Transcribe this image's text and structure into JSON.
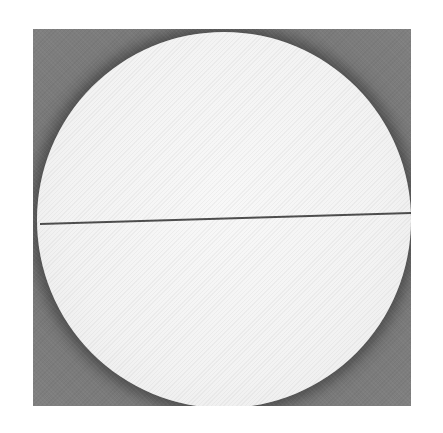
{
  "image": {
    "description": "Photograph of a white circular disc on a dark gray square background, bisected by a thin dark horizontal line",
    "colors": {
      "page_background": "#ffffff",
      "frame_background": "#6e6e6e",
      "disc": "#f3f3f3",
      "line": "#3a3a3a"
    }
  }
}
